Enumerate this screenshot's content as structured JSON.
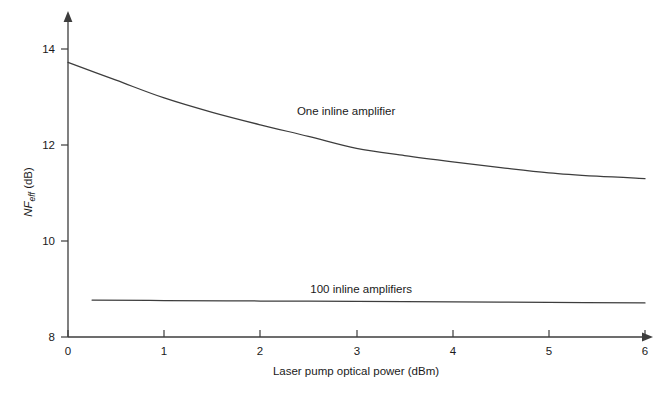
{
  "chart_data": {
    "type": "line",
    "title": "",
    "subtitle": "",
    "xlabel": "Laser pump optical power (dBm)",
    "ylabel": "NF_eff (dB)",
    "ylabel_parts": {
      "main": "NF",
      "subscript": "eff",
      "unit": " (dB)"
    },
    "xlim": [
      0,
      6
    ],
    "ylim": [
      8,
      14.4
    ],
    "xticks": [
      0,
      1,
      2,
      3,
      4,
      5,
      6
    ],
    "xtick_labels": [
      "0",
      "1",
      "2",
      "3",
      "4",
      "5",
      "6"
    ],
    "yticks": [
      8,
      10,
      12,
      14
    ],
    "ytick_labels": [
      "8",
      "10",
      "12",
      "14"
    ],
    "grid": false,
    "legend_position": "inline-annotations",
    "series": [
      {
        "name": "One inline amplifier",
        "annotation": "One inline amplifier",
        "annotation_x": 2.38,
        "annotation_y": 12.62,
        "x": [
          0.0,
          0.5,
          1.0,
          1.5,
          2.0,
          2.5,
          3.0,
          3.5,
          4.0,
          4.5,
          5.0,
          5.5,
          6.0
        ],
        "values": [
          13.72,
          13.35,
          12.98,
          12.68,
          12.42,
          12.18,
          11.93,
          11.78,
          11.65,
          11.53,
          11.42,
          11.35,
          11.3
        ]
      },
      {
        "name": "100 inline amplifiers",
        "annotation": "100 inline amplifiers",
        "annotation_x": 2.52,
        "annotation_y": 8.92,
        "x": [
          0.25,
          1.0,
          2.0,
          3.0,
          4.0,
          5.0,
          6.0
        ],
        "values": [
          8.77,
          8.76,
          8.75,
          8.74,
          8.73,
          8.72,
          8.71
        ]
      }
    ],
    "axis_style": {
      "arrow_tipped": true,
      "spines": [
        "left",
        "bottom"
      ],
      "color": "#3d3d3d"
    }
  }
}
